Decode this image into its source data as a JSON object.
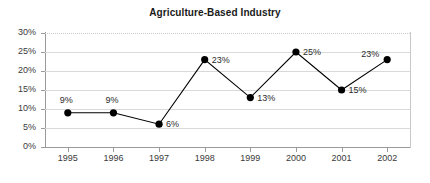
{
  "chart_data": {
    "type": "line",
    "title": "Agriculture-Based Industry",
    "xlabel": "",
    "ylabel": "",
    "categories": [
      "1995",
      "1996",
      "1997",
      "1998",
      "1999",
      "2000",
      "2001",
      "2002"
    ],
    "values": [
      9,
      9,
      6,
      23,
      13,
      25,
      15,
      23
    ],
    "point_labels": [
      "9%",
      "9%",
      "6%",
      "23%",
      "13%",
      "25%",
      "15%",
      "23%"
    ],
    "label_positions": [
      "above-left",
      "above-left",
      "right",
      "right",
      "right",
      "right",
      "right",
      "left"
    ],
    "ylim": [
      0,
      30
    ],
    "ytick_values": [
      30,
      25,
      20,
      15,
      10,
      5,
      0
    ],
    "ytick_labels": [
      "30%",
      "25%",
      "20%",
      "15%",
      "10%",
      "5%",
      "0%"
    ],
    "grid": true,
    "legend": "none",
    "marker": "filled-circle",
    "series_color": "#000000",
    "gridline_color": "#d9d9d9",
    "axis_color": "#9a9a9a"
  }
}
